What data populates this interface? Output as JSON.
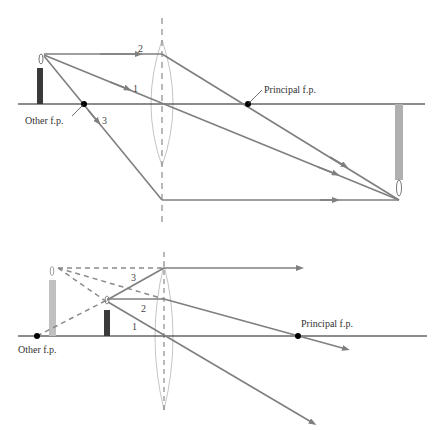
{
  "colors": {
    "axis": "#1a1a1a",
    "ray": "#7f7f7f",
    "lens": "#b5b5b5",
    "object_candle": "#3a3a3a",
    "image_candle": "#b0b0b0",
    "focal_point": "#000000",
    "label": "#333333"
  },
  "top_diagram": {
    "focal_left_label": "Other f.p.",
    "focal_right_label": "Principal f.p.",
    "ray_labels": [
      "1",
      "2",
      "3"
    ],
    "object": "candle-upright",
    "image": "candle-inverted-real"
  },
  "bottom_diagram": {
    "focal_left_label": "Other f.p.",
    "focal_right_label": "Principal f.p.",
    "ray_labels": [
      "1",
      "2",
      "3"
    ],
    "object": "candle-upright",
    "image": "candle-upright-virtual"
  }
}
